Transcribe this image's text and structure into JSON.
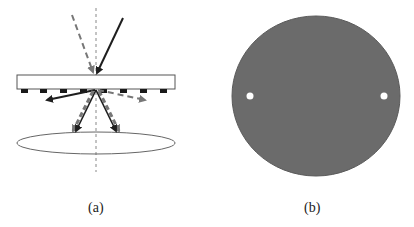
{
  "figure": {
    "panels": [
      {
        "id": "a",
        "label": "(a)",
        "description": "Light incident on a plate with a periodic grating on its underside, producing diffracted beams toward a lens/ellipse",
        "elements": {
          "optical_axis": "dashed vertical line",
          "plate": "rectangle",
          "grating": "row of dark bars under plate",
          "incident_beams": [
            "solid dark arrow",
            "dashed gray arrow"
          ],
          "diffracted_beams": [
            "solid dark arrows",
            "dashed gray arrows"
          ],
          "lens": "ellipse"
        }
      },
      {
        "id": "b",
        "label": "(b)",
        "description": "Gray circular disc with two small white spots on the horizontal diameter",
        "elements": {
          "disc_color": "#6b6b6b",
          "spots": 2
        }
      }
    ],
    "colors": {
      "solid_beam": "#1e1e1e",
      "dashed_beam": "#777777",
      "outline": "#555555",
      "grating_bar": "#1a1a1a",
      "disc": "#6b6b6b",
      "spot": "#ffffff"
    }
  }
}
